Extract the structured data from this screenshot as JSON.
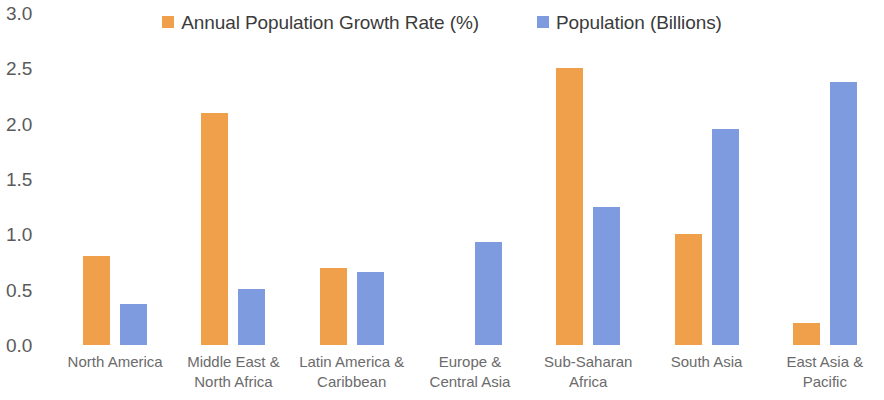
{
  "chart_data": {
    "type": "bar",
    "title": "",
    "subtitle": "",
    "xlabel": "",
    "ylabel": "",
    "ylim": [
      0,
      3.0
    ],
    "y_ticks": [
      "0.0",
      "0.5",
      "1.0",
      "1.5",
      "2.0",
      "2.5",
      "3.0"
    ],
    "y_tick_values": [
      0.0,
      0.5,
      1.0,
      1.5,
      2.0,
      2.5,
      3.0
    ],
    "grid": false,
    "legend_position": "top-center",
    "categories": [
      "North America",
      "Middle East & North Africa",
      "Latin America & Caribbean",
      "Europe & Central Asia",
      "Sub-Saharan Africa",
      "South Asia",
      "East Asia & Pacific"
    ],
    "category_lines": [
      [
        "North America"
      ],
      [
        "Middle East &",
        "North Africa"
      ],
      [
        "Latin America &",
        "Caribbean"
      ],
      [
        "Europe &",
        "Central Asia"
      ],
      [
        "Sub-Saharan",
        "Africa"
      ],
      [
        "South Asia"
      ],
      [
        "East Asia &",
        "Pacific"
      ]
    ],
    "series": [
      {
        "name": "Annual Population Growth Rate (%)",
        "color": "#F0A04B",
        "values": [
          0.8,
          2.1,
          0.7,
          0.0,
          2.5,
          1.0,
          0.2
        ]
      },
      {
        "name": "Population (Billions)",
        "color": "#7E9BE0",
        "values": [
          0.37,
          0.51,
          0.66,
          0.93,
          1.25,
          1.95,
          2.38
        ]
      }
    ]
  },
  "legend": {
    "entries": [
      {
        "label": "Annual Population Growth Rate (%)",
        "color": "#F0A04B"
      },
      {
        "label": "Population (Billions)",
        "color": "#7E9BE0"
      }
    ]
  }
}
